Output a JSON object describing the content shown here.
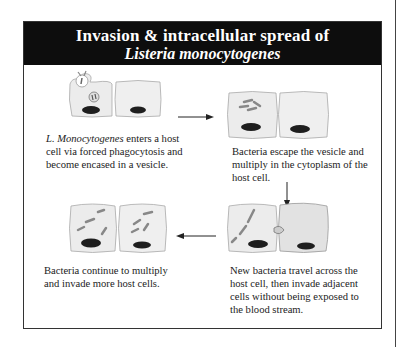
{
  "header": {
    "title_line1": "Invasion & intracellular spread of",
    "title_line2": "Listeria monocytogenes"
  },
  "steps": [
    {
      "index": 1,
      "caption_italic": "L. Monocytogenes",
      "caption_rest_line1": " enters a host",
      "caption_line2": "cell via forced phagocytosis and",
      "caption_line3": "become encased in a vesicle."
    },
    {
      "index": 2,
      "caption_line1": "Bacteria escape the vesicle and",
      "caption_line2": "multiply in the cytoplasm of the",
      "caption_line3": "host cell."
    },
    {
      "index": 3,
      "caption_line1": "New bacteria travel across the",
      "caption_line2": "host cell, then invade adjacent",
      "caption_line3": "cells without being exposed to",
      "caption_line4": "the blood stream."
    },
    {
      "index": 4,
      "caption_line1": "Bacteria continue to multiply",
      "caption_line2": "and invade more host cells."
    }
  ],
  "arrows": [
    {
      "from": 1,
      "to": 2,
      "direction": "right"
    },
    {
      "from": 2,
      "to": 3,
      "direction": "down"
    },
    {
      "from": 3,
      "to": 4,
      "direction": "left"
    }
  ],
  "colors": {
    "header_bg": "#0d0d0d",
    "header_text": "#ffffff",
    "cell_fill": "#ececec",
    "nucleus": "#1e1e1e",
    "bacteria": "#8a8a8a"
  }
}
